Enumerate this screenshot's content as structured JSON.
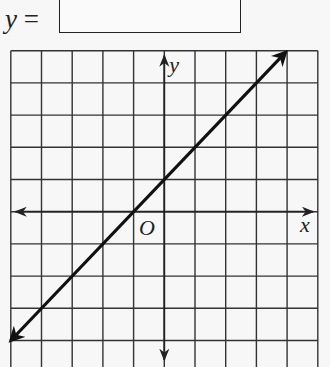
{
  "question": {
    "prefix_var": "y",
    "prefix_eq": " =",
    "answer_value": ""
  },
  "chart_data": {
    "type": "line",
    "title": "",
    "xlabel": "x",
    "ylabel": "y",
    "origin_label": "O",
    "grid": true,
    "xlim": [
      -5,
      5
    ],
    "ylim": [
      -5,
      5
    ],
    "grid_step": 1,
    "series": [
      {
        "name": "line",
        "x": [
          -5,
          -4,
          -3,
          -2,
          -1,
          0,
          1,
          2,
          3,
          4
        ],
        "y": [
          -4,
          -3,
          -2,
          -1,
          0,
          1,
          2,
          3,
          4,
          5
        ],
        "equation": "y = x + 1",
        "slope": 1,
        "intercept": 1,
        "arrows": "both"
      }
    ]
  },
  "colors": {
    "ink": "#222222",
    "background": "#f7f7f7"
  }
}
